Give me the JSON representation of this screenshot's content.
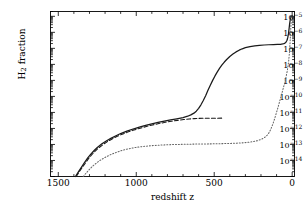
{
  "figure": {
    "xlabel": "redshift z",
    "ylabel_main": "H",
    "ylabel_sub": "2",
    "ylabel_tail": " fraction"
  },
  "axes": {
    "x_ticks": [
      {
        "value": 1500,
        "label": "1500"
      },
      {
        "value": 1000,
        "label": "1000"
      },
      {
        "value": 500,
        "label": "500"
      },
      {
        "value": 0,
        "label": "0"
      }
    ],
    "y_ticks": [
      {
        "exp": -5,
        "mantissa": "10",
        "sup": "−5"
      },
      {
        "exp": -6,
        "mantissa": "10",
        "sup": "−6"
      },
      {
        "exp": -7,
        "mantissa": "10",
        "sup": "−7"
      },
      {
        "exp": -8,
        "mantissa": "10",
        "sup": "−8"
      },
      {
        "exp": -9,
        "mantissa": "10",
        "sup": "−9"
      },
      {
        "exp": -10,
        "mantissa": "10",
        "sup": "−10"
      },
      {
        "exp": -11,
        "mantissa": "10",
        "sup": "−11"
      },
      {
        "exp": -12,
        "mantissa": "10",
        "sup": "−12"
      },
      {
        "exp": -13,
        "mantissa": "10",
        "sup": "−13"
      },
      {
        "exp": -14,
        "mantissa": "10",
        "sup": "−14"
      }
    ]
  },
  "chart_data": {
    "type": "line",
    "title": "",
    "xlabel": "redshift z",
    "ylabel": "H2 fraction",
    "xlim": [
      1550,
      -15
    ],
    "ylim": [
      1e-15,
      2e-05
    ],
    "x_reversed": true,
    "y_log": true,
    "grid": false,
    "legend": "none",
    "series": [
      {
        "name": "total H2 fraction",
        "style": "solid",
        "color": "#1a1a1a",
        "points": [
          [
            1390,
            1e-15
          ],
          [
            1370,
            2e-15
          ],
          [
            1350,
            4e-15
          ],
          [
            1330,
            8e-15
          ],
          [
            1310,
            1.5e-14
          ],
          [
            1290,
            2.6e-14
          ],
          [
            1270,
            4.2e-14
          ],
          [
            1250,
            6.5e-14
          ],
          [
            1220,
            1.1e-13
          ],
          [
            1190,
            1.7e-13
          ],
          [
            1160,
            2.5e-13
          ],
          [
            1130,
            3.5e-13
          ],
          [
            1100,
            4.8e-13
          ],
          [
            1060,
            6.8e-13
          ],
          [
            1020,
            9.2e-13
          ],
          [
            980,
            1.2e-12
          ],
          [
            940,
            1.55e-12
          ],
          [
            900,
            1.95e-12
          ],
          [
            860,
            2.4e-12
          ],
          [
            820,
            2.9e-12
          ],
          [
            780,
            3.4e-12
          ],
          [
            740,
            4e-12
          ],
          [
            700,
            4.8e-12
          ],
          [
            670,
            5.8e-12
          ],
          [
            650,
            7e-12
          ],
          [
            630,
            9e-12
          ],
          [
            615,
            1.2e-11
          ],
          [
            600,
            1.8e-11
          ],
          [
            585,
            3e-11
          ],
          [
            570,
            5.5e-11
          ],
          [
            555,
            1.1e-10
          ],
          [
            540,
            2.4e-10
          ],
          [
            525,
            5e-10
          ],
          [
            510,
            1e-09
          ],
          [
            495,
            1.9e-09
          ],
          [
            480,
            3.4e-09
          ],
          [
            465,
            5.8e-09
          ],
          [
            450,
            9.2e-09
          ],
          [
            435,
            1.4e-08
          ],
          [
            420,
            2e-08
          ],
          [
            400,
            3.1e-08
          ],
          [
            380,
            4.4e-08
          ],
          [
            360,
            6e-08
          ],
          [
            340,
            7.7e-08
          ],
          [
            320,
            9.4e-08
          ],
          [
            300,
            1.1e-07
          ],
          [
            270,
            1.3e-07
          ],
          [
            240,
            1.44e-07
          ],
          [
            210,
            1.55e-07
          ],
          [
            180,
            1.62e-07
          ],
          [
            150,
            1.68e-07
          ],
          [
            120,
            1.72e-07
          ],
          [
            95,
            1.76e-07
          ],
          [
            75,
            1.8e-07
          ],
          [
            60,
            1.88e-07
          ],
          [
            48,
            2.05e-07
          ],
          [
            40,
            2.4e-07
          ],
          [
            33,
            3.2e-07
          ],
          [
            28,
            4.8e-07
          ],
          [
            24,
            8e-07
          ],
          [
            20,
            1.6e-06
          ],
          [
            17,
            2.9e-06
          ],
          [
            14,
            4.8e-06
          ],
          [
            11,
            7e-06
          ],
          [
            8,
            8.6e-06
          ],
          [
            5,
            9.6e-06
          ],
          [
            2,
            1.02e-05
          ],
          [
            0,
            1.05e-05
          ]
        ]
      },
      {
        "name": "H2 via H- channel",
        "style": "dashed",
        "color": "#1a1a1a",
        "points": [
          [
            1385,
            1e-15
          ],
          [
            1365,
            2e-15
          ],
          [
            1345,
            3.8e-15
          ],
          [
            1325,
            7.2e-15
          ],
          [
            1305,
            1.35e-14
          ],
          [
            1285,
            2.3e-14
          ],
          [
            1265,
            3.7e-14
          ],
          [
            1245,
            5.7e-14
          ],
          [
            1215,
            9.5e-14
          ],
          [
            1185,
            1.5e-13
          ],
          [
            1155,
            2.2e-13
          ],
          [
            1125,
            3.1e-13
          ],
          [
            1095,
            4.2e-13
          ],
          [
            1055,
            5.9e-13
          ],
          [
            1015,
            8e-13
          ],
          [
            975,
            1.03e-12
          ],
          [
            935,
            1.33e-12
          ],
          [
            895,
            1.66e-12
          ],
          [
            855,
            2.02e-12
          ],
          [
            815,
            2.42e-12
          ],
          [
            775,
            2.8e-12
          ],
          [
            735,
            3.2e-12
          ],
          [
            695,
            3.6e-12
          ],
          [
            660,
            3.9e-12
          ],
          [
            630,
            4.1e-12
          ],
          [
            600,
            4.25e-12
          ],
          [
            570,
            4.32e-12
          ],
          [
            540,
            4.36e-12
          ],
          [
            510,
            4.38e-12
          ],
          [
            480,
            4.39e-12
          ],
          [
            450,
            4.4e-12
          ]
        ]
      },
      {
        "name": "H2 via H2+ channel",
        "style": "dotted",
        "color": "#666666",
        "points": [
          [
            1340,
            1e-15
          ],
          [
            1320,
            1.7e-15
          ],
          [
            1300,
            2.8e-15
          ],
          [
            1280,
            4.4e-15
          ],
          [
            1255,
            7e-15
          ],
          [
            1230,
            1.05e-14
          ],
          [
            1200,
            1.55e-14
          ],
          [
            1170,
            2.2e-14
          ],
          [
            1140,
            2.9e-14
          ],
          [
            1110,
            3.7e-14
          ],
          [
            1075,
            4.7e-14
          ],
          [
            1040,
            5.6e-14
          ],
          [
            1000,
            6.6e-14
          ],
          [
            960,
            7.4e-14
          ],
          [
            920,
            8.1e-14
          ],
          [
            880,
            8.7e-14
          ],
          [
            840,
            9.2e-14
          ],
          [
            800,
            9.6e-14
          ],
          [
            760,
            9.9e-14
          ],
          [
            720,
            1.01e-13
          ],
          [
            680,
            1.03e-13
          ],
          [
            640,
            1.05e-13
          ],
          [
            600,
            1.06e-13
          ],
          [
            560,
            1.08e-13
          ],
          [
            520,
            1.09e-13
          ],
          [
            480,
            1.11e-13
          ],
          [
            440,
            1.13e-13
          ],
          [
            400,
            1.16e-13
          ],
          [
            360,
            1.2e-13
          ],
          [
            320,
            1.26e-13
          ],
          [
            280,
            1.36e-13
          ],
          [
            250,
            1.5e-13
          ],
          [
            220,
            1.75e-13
          ],
          [
            195,
            2.15e-13
          ],
          [
            175,
            2.8e-13
          ],
          [
            160,
            3.8e-13
          ],
          [
            148,
            5.5e-13
          ],
          [
            138,
            8.5e-13
          ],
          [
            130,
            1.3e-12
          ],
          [
            122,
            2.1e-12
          ],
          [
            114,
            3.6e-12
          ],
          [
            106,
            6.5e-12
          ],
          [
            98,
            1.2e-11
          ],
          [
            90,
            2.2e-11
          ],
          [
            82,
            4.2e-11
          ],
          [
            74,
            8e-11
          ],
          [
            66,
            1.55e-10
          ],
          [
            58,
            3e-10
          ],
          [
            50,
            5.8e-10
          ],
          [
            43,
            1.1e-09
          ],
          [
            37,
            2.1e-09
          ],
          [
            31,
            4.2e-09
          ],
          [
            26,
            8.5e-09
          ],
          [
            22,
            1.8e-08
          ],
          [
            18,
            4.5e-08
          ],
          [
            15,
            1.2e-07
          ],
          [
            12,
            4e-07
          ],
          [
            10,
            1.1e-06
          ],
          [
            8,
            2.6e-06
          ],
          [
            6,
            5e-06
          ],
          [
            4,
            7.4e-06
          ],
          [
            2,
            9.2e-06
          ],
          [
            0,
            1e-05
          ]
        ]
      }
    ]
  }
}
